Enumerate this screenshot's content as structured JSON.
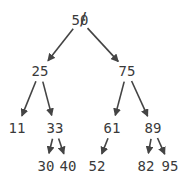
{
  "diagram": {
    "type": "binary-search-tree",
    "edge_color": "#444444",
    "text_color": "#3a3a3a",
    "nodes": [
      {
        "id": "n50",
        "label": "50",
        "x": 80,
        "y": 20,
        "deleted": true
      },
      {
        "id": "n25",
        "label": "25",
        "x": 40,
        "y": 71
      },
      {
        "id": "n75",
        "label": "75",
        "x": 127,
        "y": 71
      },
      {
        "id": "n11",
        "label": "11",
        "x": 17,
        "y": 128
      },
      {
        "id": "n33",
        "label": "33",
        "x": 55,
        "y": 128
      },
      {
        "id": "n61",
        "label": "61",
        "x": 112,
        "y": 128
      },
      {
        "id": "n89",
        "label": "89",
        "x": 153,
        "y": 128
      },
      {
        "id": "n30",
        "label": "30",
        "x": 46,
        "y": 166
      },
      {
        "id": "n40",
        "label": "40",
        "x": 68,
        "y": 166
      },
      {
        "id": "n52",
        "label": "52",
        "x": 97,
        "y": 166
      },
      {
        "id": "n82",
        "label": "82",
        "x": 146,
        "y": 166
      },
      {
        "id": "n95",
        "label": "95",
        "x": 170,
        "y": 166
      }
    ],
    "edges": [
      {
        "from": "n50",
        "to": "n25"
      },
      {
        "from": "n50",
        "to": "n75"
      },
      {
        "from": "n25",
        "to": "n11"
      },
      {
        "from": "n25",
        "to": "n33"
      },
      {
        "from": "n33",
        "to": "n30"
      },
      {
        "from": "n33",
        "to": "n40"
      },
      {
        "from": "n75",
        "to": "n61"
      },
      {
        "from": "n75",
        "to": "n89"
      },
      {
        "from": "n61",
        "to": "n52"
      },
      {
        "from": "n89",
        "to": "n82"
      },
      {
        "from": "n89",
        "to": "n95"
      }
    ],
    "strike_mark": "/"
  }
}
